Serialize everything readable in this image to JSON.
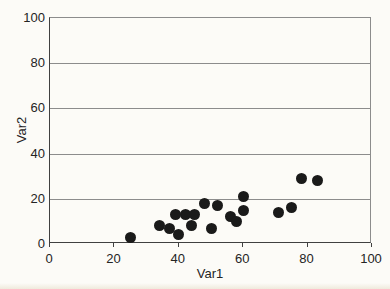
{
  "figure": {
    "background": "#fcfbf7"
  },
  "chart_data": {
    "type": "scatter",
    "title": "",
    "xlabel": "Var1",
    "ylabel": "Var2",
    "xlim": [
      0,
      100
    ],
    "ylim": [
      0,
      100
    ],
    "xticks": [
      0,
      20,
      40,
      60,
      80,
      100
    ],
    "yticks": [
      0,
      20,
      40,
      60,
      80,
      100
    ],
    "grid": "horizontal-only",
    "legend": "none",
    "marker": {
      "shape": "filled-circle",
      "diameter_px": 11,
      "color": "#1a1a1a"
    },
    "colors": {
      "axis": "#404040",
      "grid": "#8c8c8c",
      "text": "#242424"
    },
    "points": [
      [
        25,
        3
      ],
      [
        34,
        8
      ],
      [
        37,
        7
      ],
      [
        40,
        4
      ],
      [
        44,
        8
      ],
      [
        39,
        13
      ],
      [
        42,
        13
      ],
      [
        45,
        13
      ],
      [
        48,
        18
      ],
      [
        52,
        17
      ],
      [
        50,
        7
      ],
      [
        56,
        12
      ],
      [
        58,
        10
      ],
      [
        60,
        21
      ],
      [
        60,
        15
      ],
      [
        71,
        14
      ],
      [
        75,
        16
      ],
      [
        78,
        29
      ],
      [
        83,
        28
      ]
    ]
  }
}
